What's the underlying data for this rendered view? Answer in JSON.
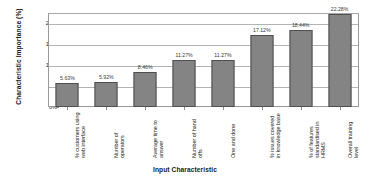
{
  "chart_data": {
    "type": "bar",
    "title": "",
    "xlabel": "Input Characteristic",
    "ylabel": "Characteristic Importance (%)",
    "ylim": [
      0,
      22.5
    ],
    "ytick_labels": [
      "20%",
      "15%",
      "10%",
      "5%",
      "0%"
    ],
    "ytick_values": [
      20,
      15,
      10,
      5,
      0
    ],
    "grid": true,
    "legend": "none",
    "categories": [
      "% customers using web interface",
      "Number of operators",
      "Average time to answer",
      "Number of hand offs",
      "One and done",
      "% issues covered in knowledge base",
      "% of features standardised in HRMS",
      "Overall training level"
    ],
    "values": [
      5.63,
      5.92,
      8.46,
      11.27,
      11.27,
      17.12,
      18.44,
      22.28
    ],
    "value_labels": [
      "5.63%",
      "5.92%",
      "8.46%",
      "11.27%",
      "11.27%",
      "17.12%",
      "18.44%",
      "22.28%"
    ],
    "bar_color": "#848484",
    "bar_edge_color": "#4f4f4f",
    "grid_color": "#b3b3b3",
    "axis_color": "#9a9a9a"
  }
}
